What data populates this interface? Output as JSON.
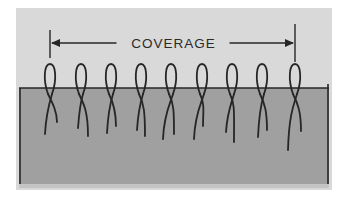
{
  "diagram": {
    "label": "COVERAGE",
    "colors": {
      "background": "#ffffff",
      "panel": "#d9d9d9",
      "skin": "#a0a0a0",
      "skin_bottom_band": "#c4c4c4",
      "ink": "#262626"
    },
    "panel": {
      "x": 16,
      "y": 8,
      "w": 316,
      "h": 182
    },
    "skin": {
      "x": 19,
      "y": 88,
      "w": 310,
      "h": 96
    },
    "dimension_line": {
      "y": 43,
      "x_start": 50,
      "x_end": 295,
      "tick_top": 30,
      "tick_bottom": 62
    },
    "hairs": [
      {
        "x": 50,
        "tail_left": [
          45,
          134
        ],
        "tail_right": [
          57,
          122
        ]
      },
      {
        "x": 81,
        "tail_left": [
          78,
          128
        ],
        "tail_right": [
          88,
          136
        ]
      },
      {
        "x": 111,
        "tail_left": [
          107,
          133
        ],
        "tail_right": [
          116,
          126
        ]
      },
      {
        "x": 141,
        "tail_left": [
          137,
          130
        ],
        "tail_right": [
          145,
          136
        ]
      },
      {
        "x": 171,
        "tail_left": [
          163,
          139
        ],
        "tail_right": [
          174,
          134
        ]
      },
      {
        "x": 202,
        "tail_left": [
          194,
          139
        ],
        "tail_right": [
          203,
          126
        ]
      },
      {
        "x": 232,
        "tail_left": [
          226,
          132
        ],
        "tail_right": [
          234,
          142
        ]
      },
      {
        "x": 262,
        "tail_left": [
          258,
          137
        ],
        "tail_right": [
          267,
          130
        ]
      },
      {
        "x": 295,
        "tail_left": [
          288,
          150
        ],
        "tail_right": [
          301,
          131
        ]
      }
    ]
  }
}
